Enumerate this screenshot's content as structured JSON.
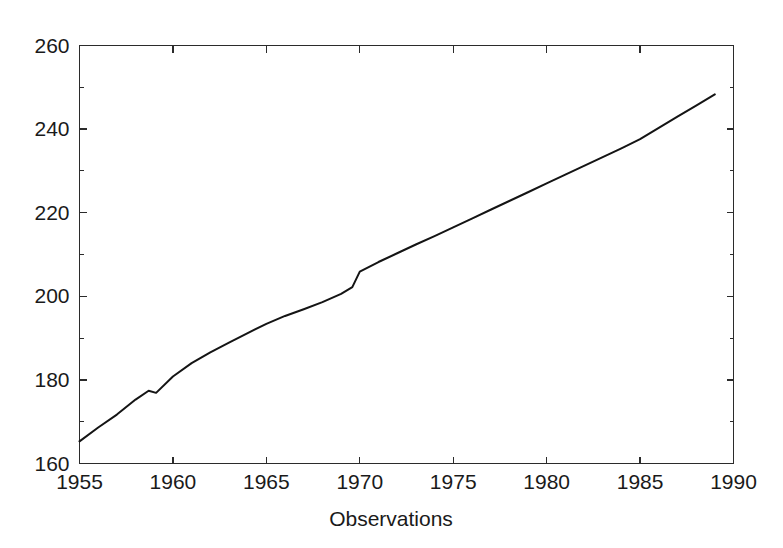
{
  "chart_data": {
    "type": "line",
    "title": "",
    "subtitle": "",
    "xlabel": "Observations",
    "ylabel": "",
    "xlim": [
      1955,
      1990
    ],
    "ylim": [
      160,
      260
    ],
    "grid": false,
    "legend": false,
    "legend_position": "none",
    "x_major_ticks": [
      1955,
      1960,
      1965,
      1970,
      1975,
      1980,
      1985,
      1990
    ],
    "x_tick_labels": [
      "1955",
      "1960",
      "1965",
      "1970",
      "1975",
      "1980",
      "1985",
      "1990"
    ],
    "y_major_ticks": [
      160,
      180,
      200,
      220,
      240,
      260
    ],
    "y_tick_labels": [
      "160",
      "180",
      "200",
      "220",
      "240",
      "260"
    ],
    "y_minor_ticks": [
      170,
      190,
      210,
      230,
      250
    ],
    "x_minor_ticks": [],
    "series": [
      {
        "name": "observations",
        "color": "#141414",
        "line_width": 2.0,
        "marker": "none",
        "x": [
          1955,
          1956,
          1957,
          1958,
          1958.7,
          1959.1,
          1960,
          1961,
          1962,
          1963,
          1964,
          1965,
          1966,
          1967,
          1968,
          1969,
          1969.6,
          1970,
          1971,
          1972,
          1973,
          1974,
          1975,
          1976,
          1977,
          1978,
          1979,
          1980,
          1981,
          1982,
          1983,
          1984,
          1985,
          1986,
          1987,
          1988,
          1989
        ],
        "values": [
          165.3,
          168.6,
          171.7,
          175.3,
          177.4,
          176.9,
          180.8,
          184.0,
          186.6,
          188.9,
          191.2,
          193.4,
          195.3,
          196.9,
          198.6,
          200.6,
          202.2,
          205.9,
          208.2,
          210.3,
          212.4,
          214.4,
          216.5,
          218.6,
          220.7,
          222.8,
          224.9,
          227.0,
          229.1,
          231.2,
          233.3,
          235.4,
          237.6,
          240.3,
          243.0,
          245.6,
          248.3
        ]
      }
    ],
    "annotations": []
  },
  "axis": {
    "x_title": "Observations",
    "y_title": ""
  },
  "colors": {
    "background": "#ffffff",
    "frame": "#2b2b2b",
    "line": "#141414",
    "text": "#1a1a1a"
  }
}
